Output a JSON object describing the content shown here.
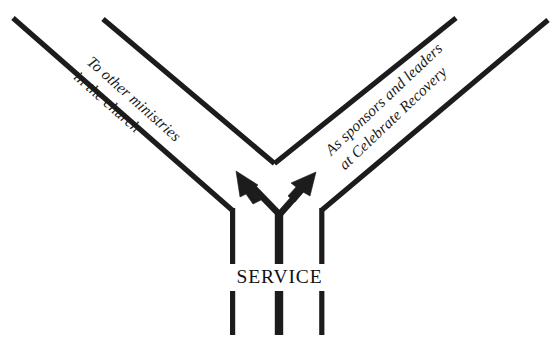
{
  "diagram": {
    "title": "SERVICE",
    "type": "fork-road-diagram",
    "center_label": "SERVICE",
    "line_color": "#1c1c1c",
    "background_color": "#ffffff",
    "text_color": "#1a1a1a",
    "branches": [
      {
        "id": "left",
        "direction": "upper-left",
        "caption_line_1": "To other ministries",
        "caption_line_2": "in the church",
        "caption_full": "To other ministries in the church"
      },
      {
        "id": "right",
        "direction": "upper-right",
        "caption_line_1": "As sponsors and leaders",
        "caption_line_2": "at Celebrate Recovery",
        "caption_full": "As sponsors and leaders at Celebrate Recovery"
      }
    ]
  }
}
